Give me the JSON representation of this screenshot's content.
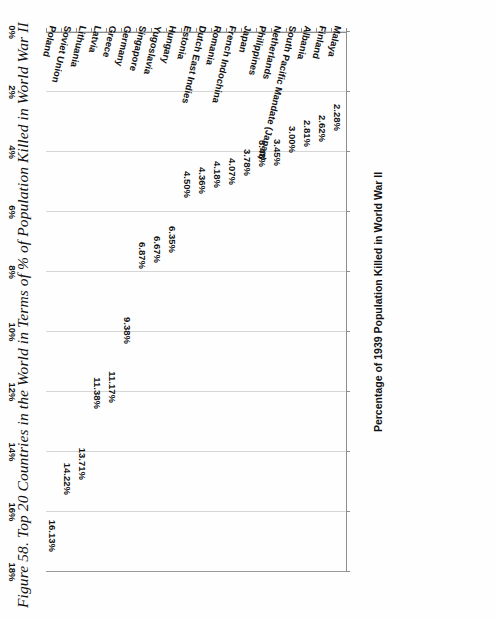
{
  "figure": {
    "title": "Figure 58. Top 20 Countries in the World in Terms of % of Population Killed in World War II"
  },
  "chart_data": {
    "type": "bar",
    "orientation": "horizontal",
    "title": "Figure 58. Top 20 Countries in the World in Terms of % of Population Killed in World War II",
    "xlabel": "Percentage of 1939 Population Killed in World War II",
    "ylabel": "",
    "xlim": [
      0,
      18
    ],
    "x_reversed": true,
    "grid": true,
    "legend": false,
    "x_tick_labels": [
      "18%",
      "16%",
      "14%",
      "12%",
      "10%",
      "8%",
      "6%",
      "4%",
      "2%",
      "0%"
    ],
    "x_ticks": [
      18,
      16,
      14,
      12,
      10,
      8,
      6,
      4,
      2,
      0
    ],
    "categories": [
      "Poland",
      "Soviet Union",
      "Lithuania",
      "Latvia",
      "Greece",
      "Germany",
      "Singapore",
      "Yugoslavia",
      "Hungary",
      "Estonia",
      "Dutch East Indies",
      "Romania",
      "French Indochina",
      "Japan",
      "Philippines",
      "Netherlands",
      "South Pacific Mandate (Japan)",
      "Albania",
      "Finland",
      "Malaya"
    ],
    "values": [
      16.13,
      14.22,
      13.71,
      11.38,
      11.17,
      9.38,
      6.87,
      6.67,
      6.35,
      4.5,
      4.36,
      4.18,
      4.07,
      3.78,
      3.48,
      3.45,
      3.0,
      2.81,
      2.62,
      2.28
    ],
    "value_labels": [
      "16.13%",
      "14.22%",
      "13.71%",
      "11.38%",
      "11.17%",
      "9.38%",
      "6.87%",
      "6.67%",
      "6.35%",
      "4.50%",
      "4.36%",
      "4.18%",
      "4.07%",
      "3.78%",
      "3.48%",
      "3.45%",
      "3.00%",
      "2.81%",
      "2.62%",
      "2.28%"
    ],
    "bar_color": "#cfcfcf",
    "gridline_color": "#d6d6d6",
    "axis_color": "#8d8d8d"
  }
}
